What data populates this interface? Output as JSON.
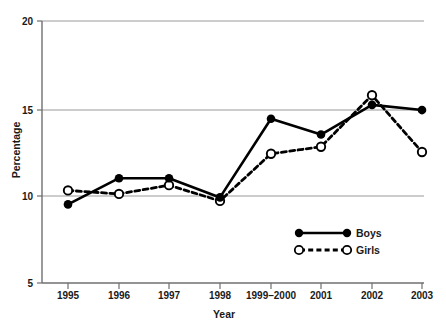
{
  "chart_data": {
    "type": "line",
    "title": "",
    "xlabel": "Year",
    "ylabel": "Percentage",
    "categories": [
      "1995",
      "1996",
      "1997",
      "1998",
      "1999–2000",
      "2001",
      "2002",
      "2003"
    ],
    "series": [
      {
        "name": "Boys",
        "marker": "filled-circle",
        "line_style": "solid",
        "color": "#000000",
        "values": [
          9.5,
          11.0,
          11.0,
          9.9,
          14.4,
          13.5,
          15.2,
          14.9
        ]
      },
      {
        "name": "Girls",
        "marker": "open-circle",
        "line_style": "dashed",
        "color": "#000000",
        "values": [
          10.3,
          10.1,
          10.6,
          9.7,
          12.4,
          12.8,
          15.75,
          12.5
        ]
      }
    ],
    "ylim": [
      5,
      20
    ],
    "yticks": [
      5,
      10,
      15,
      20
    ],
    "ytick_labels": [
      "5",
      "10",
      "15",
      "20"
    ],
    "grid": "horizontal",
    "legend_position": "inside-bottom-right"
  },
  "axes": {
    "y_title": "Percentage",
    "x_title": "Year"
  },
  "legend": {
    "items": [
      {
        "label": "Boys"
      },
      {
        "label": "Girls"
      }
    ]
  },
  "colors": {
    "ink": "#000000",
    "grid": "#9a9a9a",
    "axis": "#6f6f6f",
    "background": "#ffffff"
  }
}
